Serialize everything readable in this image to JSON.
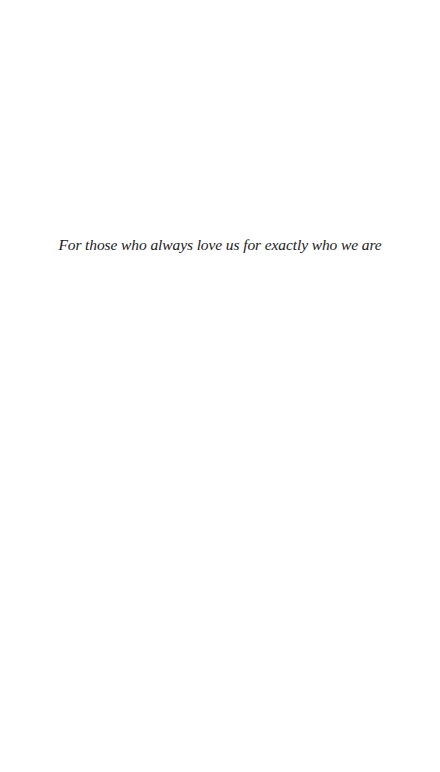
{
  "page": {
    "type": "dedication",
    "dedication_text": "For those who always love us for exactly who we are"
  }
}
